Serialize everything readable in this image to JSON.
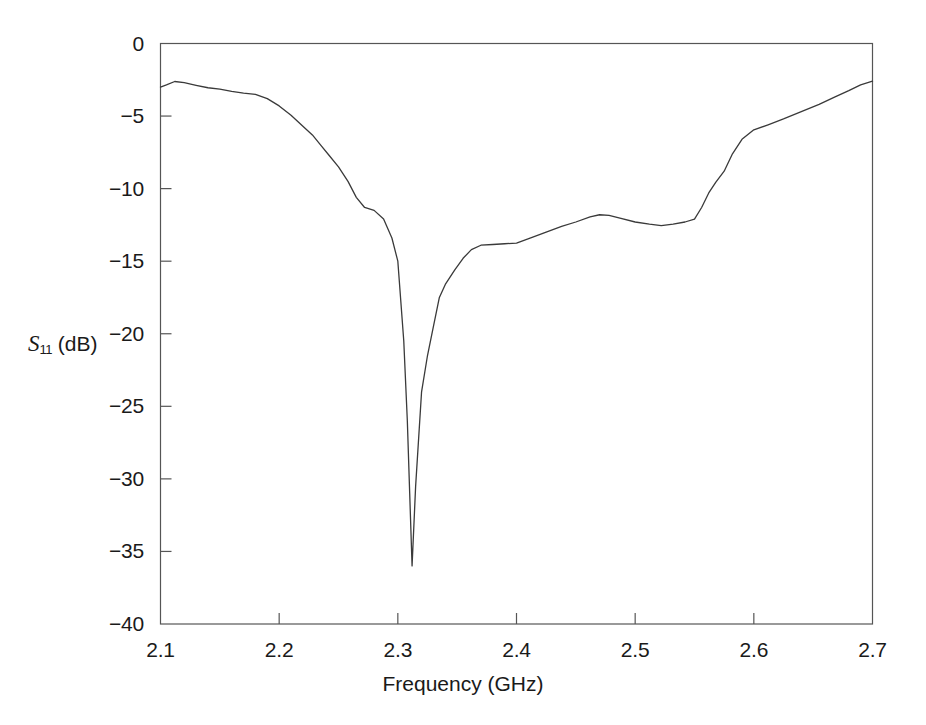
{
  "chart_data": {
    "type": "line",
    "title": "",
    "subtitle": "",
    "xlabel": "Frequency (GHz)",
    "ylabel": "S11 (dB)",
    "ylabel_symbol": "S",
    "ylabel_subscript": "11",
    "ylabel_unit": "(dB)",
    "xlim": [
      2.1,
      2.7
    ],
    "ylim": [
      -40,
      0
    ],
    "xticks": [
      2.1,
      2.2,
      2.3,
      2.4,
      2.5,
      2.6,
      2.7
    ],
    "xtick_labels": [
      "2.1",
      "2.2",
      "2.3",
      "2.4",
      "2.5",
      "2.6",
      "2.7"
    ],
    "yticks": [
      0,
      -5,
      -10,
      -15,
      -20,
      -25,
      -30,
      -35,
      -40
    ],
    "ytick_labels": [
      "0",
      "−5",
      "−10",
      "−15",
      "−20",
      "−25",
      "−30",
      "−35",
      "−40"
    ],
    "grid": false,
    "legend": null,
    "legend_position": "none",
    "line_color": "#3a3a3a",
    "line_width": 1.3,
    "frame_color": "#555555",
    "background": "#ffffff",
    "series": [
      {
        "name": "S11",
        "x": [
          2.1,
          2.105,
          2.112,
          2.12,
          2.13,
          2.14,
          2.15,
          2.16,
          2.17,
          2.18,
          2.19,
          2.2,
          2.21,
          2.22,
          2.228,
          2.235,
          2.242,
          2.25,
          2.258,
          2.265,
          2.272,
          2.28,
          2.288,
          2.295,
          2.3,
          2.305,
          2.308,
          2.31,
          2.312,
          2.315,
          2.32,
          2.325,
          2.33,
          2.335,
          2.34,
          2.348,
          2.355,
          2.362,
          2.37,
          2.38,
          2.39,
          2.4,
          2.412,
          2.425,
          2.438,
          2.45,
          2.462,
          2.47,
          2.478,
          2.488,
          2.5,
          2.512,
          2.522,
          2.532,
          2.542,
          2.55,
          2.556,
          2.562,
          2.568,
          2.575,
          2.582,
          2.59,
          2.6,
          2.612,
          2.625,
          2.64,
          2.655,
          2.668,
          2.68,
          2.69,
          2.7
        ],
        "y": [
          -3.0,
          -2.85,
          -2.62,
          -2.7,
          -2.88,
          -3.05,
          -3.15,
          -3.3,
          -3.42,
          -3.5,
          -3.8,
          -4.3,
          -4.95,
          -5.7,
          -6.3,
          -7.0,
          -7.7,
          -8.5,
          -9.5,
          -10.6,
          -11.3,
          -11.5,
          -12.1,
          -13.4,
          -15.0,
          -20.5,
          -26.0,
          -31.0,
          -36.0,
          -30.5,
          -24.0,
          -21.5,
          -19.5,
          -17.5,
          -16.6,
          -15.6,
          -14.8,
          -14.2,
          -13.9,
          -13.85,
          -13.8,
          -13.75,
          -13.4,
          -13.0,
          -12.6,
          -12.3,
          -11.95,
          -11.8,
          -11.85,
          -12.05,
          -12.3,
          -12.45,
          -12.55,
          -12.45,
          -12.3,
          -12.1,
          -11.3,
          -10.3,
          -9.55,
          -8.8,
          -7.6,
          -6.6,
          -5.95,
          -5.6,
          -5.2,
          -4.7,
          -4.2,
          -3.7,
          -3.25,
          -2.85,
          -2.6
        ],
        "key_points": {
          "start": {
            "x": 2.1,
            "y": -3.0
          },
          "local_max_left": {
            "x": 2.112,
            "y": -2.62
          },
          "resonance_min": {
            "x": 2.312,
            "y": -36.0
          },
          "plateau_mid": {
            "x": 2.4,
            "y": -13.75
          },
          "local_max_mid": {
            "x": 2.47,
            "y": -11.8
          },
          "local_min_right": {
            "x": 2.522,
            "y": -12.55
          },
          "end": {
            "x": 2.7,
            "y": -2.6
          }
        }
      }
    ]
  }
}
